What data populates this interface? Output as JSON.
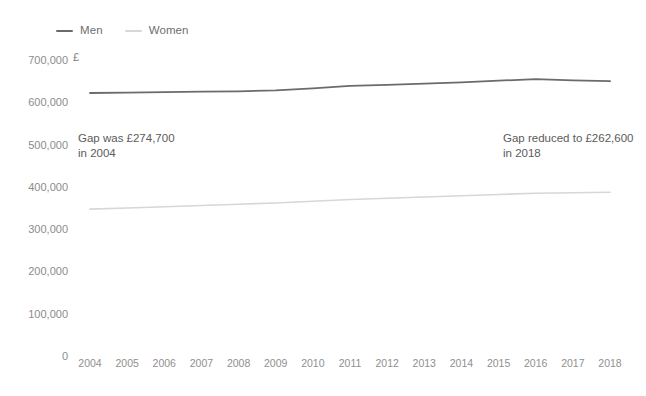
{
  "legend": {
    "position": "top-left",
    "items": [
      {
        "label": "Men",
        "color": "#6b6b6b"
      },
      {
        "label": "Women",
        "color": "#d7d7d7"
      }
    ]
  },
  "axis_unit": "£",
  "annotations": [
    {
      "name": "gap-2004",
      "text": "Gap was £274,700\nin 2004"
    },
    {
      "name": "gap-2018",
      "text": "Gap reduced to £262,600\nin 2018"
    }
  ],
  "chart_data": {
    "type": "line",
    "title": "",
    "subtitle": "",
    "xlabel": "",
    "ylabel": "£",
    "grid": false,
    "legend_position": "top-left",
    "x": [
      "2004",
      "2005",
      "2006",
      "2007",
      "2008",
      "2009",
      "2010",
      "2011",
      "2012",
      "2013",
      "2014",
      "2015",
      "2016",
      "2017",
      "2018"
    ],
    "xlim": [
      2004,
      2018
    ],
    "ylim": [
      0,
      700000
    ],
    "ytick_labels": [
      "700,000",
      "600,000",
      "500,000",
      "400,000",
      "300,000",
      "200,000",
      "100,000",
      "0"
    ],
    "yticks": [
      700000,
      600000,
      500000,
      400000,
      300000,
      200000,
      100000,
      0
    ],
    "series": [
      {
        "name": "Men",
        "color": "#6b6b6b",
        "values": [
          622000,
          623000,
          624000,
          625000,
          626000,
          628000,
          633000,
          639000,
          641000,
          644000,
          647000,
          651000,
          655000,
          652000,
          650000
        ]
      },
      {
        "name": "Women",
        "color": "#d7d7d7",
        "values": [
          347300,
          350000,
          353000,
          356000,
          359000,
          362000,
          366000,
          370000,
          373000,
          376000,
          379000,
          382000,
          385000,
          386000,
          387400
        ]
      }
    ],
    "annotations": [
      {
        "text": "Gap was £274,700 in 2004",
        "x": "2004",
        "value": 274700
      },
      {
        "text": "Gap reduced to £262,600 in 2018",
        "x": "2018",
        "value": 262600
      }
    ]
  }
}
